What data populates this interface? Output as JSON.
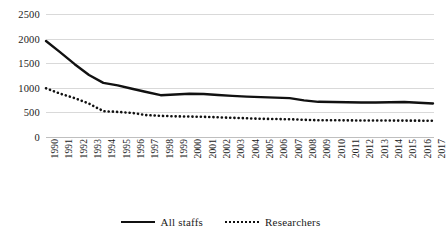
{
  "chart_data": {
    "type": "line",
    "title": "",
    "subtitle": "",
    "xlabel": "",
    "ylabel": "",
    "ylim": [
      0,
      2500
    ],
    "ytick_step": 500,
    "yticks": [
      "0",
      "500",
      "1000",
      "1500",
      "2000",
      "2500"
    ],
    "grid": true,
    "legend_position": "bottom-center",
    "categories": [
      "1990",
      "1991",
      "1992",
      "1993",
      "1994",
      "1995",
      "1996",
      "1997",
      "1998",
      "1999",
      "2000",
      "2001",
      "2002",
      "2003",
      "2004",
      "2005",
      "2006",
      "2007",
      "2008",
      "2009",
      "2010",
      "2011",
      "2012",
      "2013",
      "2014",
      "2015",
      "2016",
      "2017"
    ],
    "series": [
      {
        "name": "All staffs",
        "style": "solid",
        "color": "#111111",
        "values": [
          1950,
          1720,
          1480,
          1260,
          1100,
          1050,
          980,
          915,
          850,
          865,
          880,
          875,
          855,
          835,
          820,
          810,
          800,
          790,
          745,
          715,
          710,
          705,
          700,
          700,
          705,
          710,
          695,
          680
        ]
      },
      {
        "name": "Researchers",
        "style": "dotted",
        "color": "#111111",
        "values": [
          990,
          880,
          790,
          680,
          525,
          510,
          490,
          445,
          430,
          420,
          415,
          410,
          400,
          390,
          380,
          370,
          365,
          360,
          350,
          340,
          340,
          338,
          335,
          335,
          334,
          333,
          332,
          330
        ]
      }
    ]
  },
  "legend": {
    "items": [
      {
        "label": "All staffs",
        "style": "solid"
      },
      {
        "label": "Researchers",
        "style": "dotted"
      }
    ]
  }
}
